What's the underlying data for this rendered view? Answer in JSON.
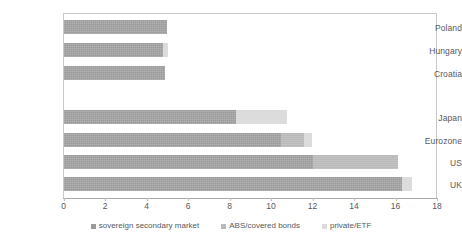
{
  "chart_data": {
    "type": "bar",
    "orientation": "horizontal",
    "stacked": true,
    "title": "",
    "xlabel": "",
    "ylabel": "",
    "xlim": [
      0,
      18
    ],
    "xticks": [
      0,
      2,
      4,
      6,
      8,
      10,
      12,
      14,
      16,
      18
    ],
    "grid": false,
    "legend_position": "bottom",
    "categories": [
      "Poland",
      "Hungary",
      "Croatia",
      "",
      "Japan",
      "Eurozone",
      "US",
      "UK"
    ],
    "series": [
      {
        "name": "sovereign secondary market",
        "color": "#9a9a9a",
        "values": [
          5.0,
          4.8,
          4.9,
          0,
          8.3,
          10.5,
          12.0,
          16.3
        ]
      },
      {
        "name": "ABS/covered bonds",
        "color": "#b9b9b9",
        "values": [
          0,
          0,
          0,
          0,
          0,
          1.1,
          4.1,
          0
        ]
      },
      {
        "name": "private/ETF",
        "color": "#dcdcdc",
        "values": [
          0,
          0.25,
          0,
          0,
          2.45,
          0.4,
          0,
          0.5
        ]
      }
    ],
    "totals": [
      5.0,
      5.05,
      4.9,
      0,
      10.75,
      12.0,
      16.1,
      16.8
    ]
  },
  "legend": {
    "items": [
      {
        "label": "sovereign secondary market",
        "color": "#9a9a9a"
      },
      {
        "label": "ABS/covered bonds",
        "color": "#b9b9b9"
      },
      {
        "label": "private/ETF",
        "color": "#dcdcdc"
      }
    ]
  },
  "axis": {
    "x_tick_labels": [
      "0",
      "2",
      "4",
      "6",
      "8",
      "10",
      "12",
      "14",
      "16",
      "18"
    ]
  }
}
